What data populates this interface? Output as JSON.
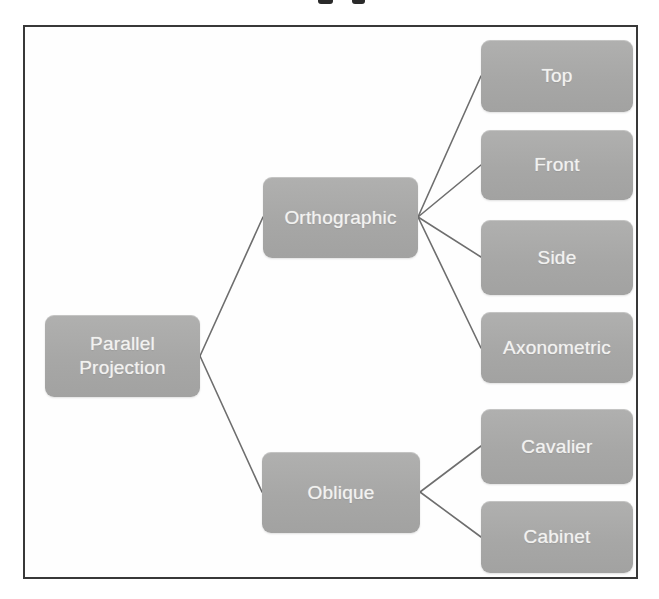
{
  "diagram": {
    "nodes": {
      "root": {
        "label": "Parallel Projection"
      },
      "orthographic": {
        "label": "Orthographic"
      },
      "oblique": {
        "label": "Oblique"
      },
      "top": {
        "label": "Top"
      },
      "front": {
        "label": "Front"
      },
      "side": {
        "label": "Side"
      },
      "axonometric": {
        "label": "Axonometric"
      },
      "cavalier": {
        "label": "Cavalier"
      },
      "cabinet": {
        "label": "Cabinet"
      }
    },
    "edges": [
      [
        "Parallel Projection",
        "Orthographic"
      ],
      [
        "Parallel Projection",
        "Oblique"
      ],
      [
        "Orthographic",
        "Top"
      ],
      [
        "Orthographic",
        "Front"
      ],
      [
        "Orthographic",
        "Side"
      ],
      [
        "Orthographic",
        "Axonometric"
      ],
      [
        "Oblique",
        "Cavalier"
      ],
      [
        "Oblique",
        "Cabinet"
      ]
    ],
    "colors": {
      "node_fill": "#a8a8a7",
      "node_text": "#f2f2f0",
      "connector": "#6e6e6e",
      "frame_border": "#383838",
      "background": "#ffffff"
    }
  }
}
